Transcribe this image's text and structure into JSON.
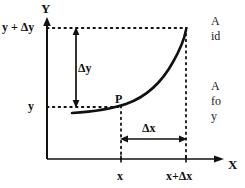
{
  "figure": {
    "type": "math-diagram",
    "background_color": "#ffffff",
    "ink_color": "#111111",
    "axes": {
      "y_axis_label": "Y",
      "x_axis_label": "X",
      "origin": {
        "x": 47,
        "y": 159
      },
      "y_axis_top": {
        "x": 47,
        "y": 22
      },
      "x_axis_right": {
        "x": 222,
        "y": 159
      }
    },
    "labels": {
      "y_plus_delta_y": "y + Δy",
      "y": "y",
      "delta_y": "Δy",
      "delta_x": "Δx",
      "point_p": "P",
      "tick_x": "x",
      "tick_x_plus_delta_x": "x+Δx"
    },
    "guides": {
      "horizontal_dotted_upper_y": 28,
      "horizontal_dotted_lower_y": 107,
      "vertical_dotted_x_left": 121,
      "vertical_dotted_x_right": 186
    },
    "curve": {
      "shape": "convex-increasing",
      "start": {
        "x": 72,
        "y": 113
      },
      "through_point_p": {
        "x": 121,
        "y": 107
      },
      "end": {
        "x": 186,
        "y": 30
      }
    },
    "arrows": {
      "delta_y_arrow": {
        "x": 76,
        "y_top": 28,
        "y_bottom": 107,
        "double_headed": true
      },
      "delta_x_arrow": {
        "y": 139,
        "x_left": 121,
        "x_right": 186,
        "double_headed": true
      }
    }
  },
  "margin_text": {
    "top_block": [
      "A",
      "id"
    ],
    "bottom_block": [
      "A",
      "fo",
      "y"
    ]
  }
}
